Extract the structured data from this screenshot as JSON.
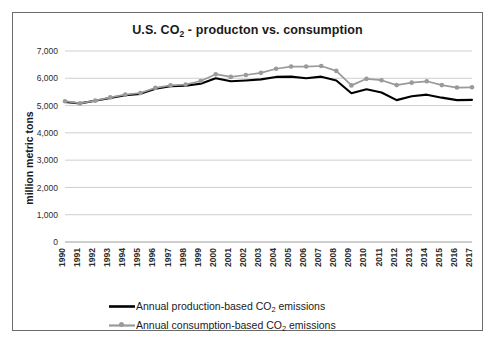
{
  "frame": {
    "border_color": "#6b6b6b",
    "background": "#ffffff"
  },
  "chart_data": {
    "type": "line",
    "title": "U.S. CO2 - producton vs. consumption",
    "title_parts": {
      "before": "U.S. CO",
      "sub": "2",
      "after": " - producton vs. consumption"
    },
    "xlabel": "",
    "ylabel": "million metric tons",
    "ylim": [
      0,
      7000
    ],
    "ytick_labels": [
      "7,000",
      "6,000",
      "5,000",
      "4,000",
      "3,000",
      "2,000",
      "1,000",
      "0"
    ],
    "ytick_values": [
      7000,
      6000,
      5000,
      4000,
      3000,
      2000,
      1000,
      0
    ],
    "grid": true,
    "legend_position": "bottom",
    "categories": [
      "1990",
      "1991",
      "1992",
      "1993",
      "1994",
      "1995",
      "1996",
      "1997",
      "1998",
      "1999",
      "2000",
      "2001",
      "2002",
      "2003",
      "2004",
      "2005",
      "2006",
      "2007",
      "2008",
      "2009",
      "2010",
      "2011",
      "2012",
      "2013",
      "2014",
      "2015",
      "2016",
      "2017"
    ],
    "series": [
      {
        "name": "Annual production-based CO2 emissions",
        "name_parts": {
          "before": "Annual production-based CO",
          "sub": "2",
          "after": " emissions"
        },
        "color": "#000000",
        "marker": "none",
        "values": [
          5130,
          5080,
          5180,
          5280,
          5380,
          5430,
          5620,
          5710,
          5730,
          5800,
          6000,
          5890,
          5920,
          5960,
          6050,
          6060,
          6000,
          6060,
          5920,
          5450,
          5600,
          5480,
          5200,
          5340,
          5400,
          5290,
          5200,
          5210
        ]
      },
      {
        "name": "Annual consumption-based CO2 emissions",
        "name_parts": {
          "before": "Annual consumption-based CO",
          "sub": "2",
          "after": " emissions"
        },
        "color": "#9a9a9a",
        "marker": "circle",
        "values": [
          5160,
          5080,
          5180,
          5300,
          5400,
          5460,
          5650,
          5740,
          5770,
          5900,
          6150,
          6050,
          6120,
          6200,
          6350,
          6430,
          6430,
          6450,
          6270,
          5740,
          5980,
          5930,
          5750,
          5840,
          5890,
          5750,
          5660,
          5670
        ]
      }
    ]
  },
  "legend": {
    "items": [
      {
        "label": "Annual production-based CO2 emissions",
        "before": "Annual production-based CO",
        "sub": "2",
        "after": " emissions",
        "color": "#000000",
        "marker": false
      },
      {
        "label": "Annual consumption-based CO2 emissions",
        "before": "Annual consumption-based CO",
        "sub": "2",
        "after": " emissions",
        "color": "#9a9a9a",
        "marker": true
      }
    ]
  }
}
